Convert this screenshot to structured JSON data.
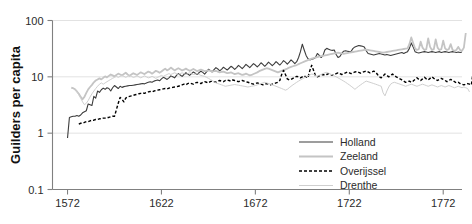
{
  "chart_data": {
    "type": "line",
    "title": "",
    "xlabel": "",
    "ylabel": "Guilders per capita",
    "yscale": "log",
    "ylim": [
      0.1,
      100
    ],
    "xlim": [
      1564,
      1782
    ],
    "grid": true,
    "grid_axis": "y",
    "legend_position": "bottom-right",
    "y_ticks": [
      "100",
      "10",
      "1",
      "0.1"
    ],
    "y_tick_values": [
      100,
      10,
      1,
      0.1
    ],
    "x_ticks": [
      "1572",
      "1622",
      "1672",
      "1722",
      "1772"
    ],
    "x_tick_values": [
      1572,
      1622,
      1672,
      1722,
      1772
    ],
    "series": [
      {
        "name": "Holland",
        "color": "#3c3c3c",
        "width": 1.1,
        "dash": "none",
        "x_start": 1572,
        "x_step": 1,
        "values": [
          0.82,
          1.9,
          1.95,
          2.0,
          2.0,
          2.05,
          2.0,
          2.1,
          2.3,
          2.4,
          2.5,
          3.3,
          3.2,
          3.1,
          4.5,
          4.2,
          5.6,
          5.3,
          5.9,
          6.3,
          6.0,
          6.4,
          6.2,
          5.6,
          6.4,
          7.0,
          6.6,
          6.2,
          6.8,
          6.5,
          6.7,
          6.8,
          6.9,
          7.0,
          7.0,
          7.1,
          7.2,
          7.3,
          7.4,
          7.5,
          7.6,
          7.5,
          7.8,
          8.0,
          8.2,
          8.0,
          8.4,
          8.6,
          8.8,
          8.5,
          9.2,
          9.8,
          9.4,
          9.0,
          9.6,
          10.4,
          10.0,
          9.6,
          10.6,
          11.4,
          10.8,
          10.2,
          11.0,
          11.8,
          11.2,
          10.6,
          11.4,
          12.2,
          11.6,
          11.0,
          11.8,
          12.6,
          12.0,
          11.2,
          12.2,
          13.6,
          13.0,
          12.2,
          13.4,
          14.6,
          13.8,
          12.8,
          13.6,
          14.8,
          14.0,
          13.2,
          14.2,
          15.4,
          14.6,
          13.6,
          14.6,
          16.0,
          15.0,
          14.0,
          15.2,
          16.6,
          15.6,
          14.6,
          15.8,
          17.2,
          16.2,
          15.0,
          16.2,
          17.8,
          16.6,
          15.4,
          16.6,
          18.2,
          17.0,
          15.8,
          17.0,
          18.6,
          17.4,
          16.2,
          17.6,
          19.4,
          18.2,
          16.8,
          18.2,
          20.0,
          18.6,
          17.2,
          18.6,
          22.0,
          28.0,
          38.0,
          30.0,
          24.0,
          21.0,
          20.0,
          20.5,
          21.0,
          22.0,
          26.0,
          24.0,
          22.0,
          24.0,
          30.0,
          32.0,
          31.0,
          30.0,
          29.5,
          30.0,
          25.0,
          22.0,
          23.0,
          26.0,
          28.5,
          29.0,
          28.5,
          28.0,
          28.5,
          32.0,
          34.0,
          35.0,
          36.0,
          35.5,
          35.0,
          34.0,
          29.0,
          26.0,
          25.5,
          25.0,
          24.5,
          25.0,
          25.5,
          26.0,
          25.5,
          25.0,
          24.5,
          25.0,
          24.5,
          24.0,
          24.5,
          25.0,
          25.5,
          26.0,
          26.5,
          27.0,
          26.0,
          27.0,
          28.0,
          32.0,
          40.0,
          34.0,
          28.0,
          27.0,
          26.5,
          27.0,
          27.5,
          28.0,
          27.5,
          27.0,
          27.5,
          28.0,
          27.5,
          27.0,
          27.5,
          28.0,
          27.0,
          27.5,
          28.0,
          27.5,
          27.0,
          27.5,
          28.0,
          27.5,
          27.0,
          27.5,
          27.0,
          27.5
        ]
      },
      {
        "name": "Zeeland",
        "color": "#c4c4c4",
        "width": 1.8,
        "dash": "none",
        "x_start": 1574,
        "x_step": 1,
        "values": [
          6.4,
          6.3,
          6.0,
          5.5,
          5.0,
          4.4,
          4.0,
          4.4,
          5.2,
          6.0,
          6.6,
          7.2,
          8.0,
          8.6,
          9.0,
          9.4,
          9.0,
          9.6,
          10.2,
          9.8,
          10.4,
          11.0,
          10.6,
          10.2,
          10.8,
          11.4,
          11.0,
          10.6,
          11.2,
          11.8,
          11.0,
          10.4,
          11.0,
          11.6,
          11.2,
          10.8,
          11.4,
          12.0,
          11.6,
          11.2,
          11.8,
          12.4,
          12.0,
          11.4,
          12.0,
          12.8,
          12.4,
          11.8,
          12.4,
          13.2,
          14.0,
          13.0,
          13.6,
          14.6,
          13.8,
          13.0,
          13.6,
          14.2,
          13.6,
          13.0,
          13.4,
          14.0,
          13.4,
          12.8,
          13.2,
          13.8,
          13.2,
          12.6,
          13.0,
          13.4,
          13.0,
          12.6,
          12.8,
          13.0,
          12.8,
          12.4,
          12.6,
          12.8,
          12.4,
          12.0,
          12.2,
          12.4,
          12.0,
          11.6,
          11.8,
          12.0,
          11.6,
          11.2,
          11.4,
          11.6,
          11.2,
          10.8,
          11.0,
          11.4,
          11.0,
          10.6,
          10.8,
          11.2,
          11.6,
          12.0,
          12.6,
          13.0,
          13.4,
          13.8,
          14.2,
          14.0,
          13.6,
          13.2,
          12.8,
          12.4,
          12.0,
          12.4,
          12.8,
          13.2,
          13.6,
          14.0,
          14.6,
          15.0,
          15.4,
          15.8,
          16.2,
          16.8,
          17.4,
          18.0,
          18.6,
          19.2,
          19.8,
          20.4,
          21.0,
          21.6,
          22.0,
          22.4,
          22.8,
          23.2,
          23.6,
          24.0,
          24.4,
          24.8,
          25.2,
          25.6,
          26.0,
          26.4,
          26.8,
          26.4,
          26.0,
          25.6,
          26.0,
          26.4,
          26.8,
          27.2,
          27.6,
          28.0,
          28.4,
          28.8,
          29.2,
          29.6,
          30.0,
          30.4,
          30.0,
          29.6,
          29.2,
          28.8,
          28.4,
          28.0,
          27.6,
          27.2,
          26.8,
          27.2,
          27.6,
          28.0,
          28.4,
          28.8,
          29.2,
          29.6,
          30.0,
          30.4,
          30.8,
          31.2,
          31.6,
          32.0,
          38.0,
          50.0,
          40.0,
          32.0,
          30.0,
          31.0,
          42.0,
          33.0,
          30.0,
          31.0,
          48.0,
          34.0,
          30.0,
          31.0,
          46.0,
          33.0,
          30.0,
          31.0,
          44.0,
          32.0,
          30.0,
          31.0,
          38.0,
          30.0,
          29.0,
          30.0,
          34.0,
          30.0,
          29.0,
          33.0,
          60.0
        ]
      },
      {
        "name": "Overijssel",
        "color": "#000000",
        "width": 1.4,
        "dash": "3 2",
        "x_start": 1578,
        "x_step": 1,
        "values": [
          1.45,
          1.5,
          1.5,
          1.55,
          1.6,
          1.6,
          1.65,
          1.7,
          1.7,
          1.75,
          1.75,
          1.8,
          1.8,
          1.85,
          1.85,
          1.9,
          1.9,
          1.95,
          2.0,
          2.0,
          2.6,
          3.4,
          4.3,
          4.0,
          3.6,
          4.2,
          4.4,
          4.5,
          4.6,
          4.7,
          4.8,
          4.9,
          5.0,
          5.1,
          5.2,
          5.1,
          5.3,
          5.4,
          5.5,
          5.4,
          5.6,
          5.7,
          5.8,
          5.9,
          6.0,
          6.1,
          6.2,
          6.1,
          6.3,
          6.4,
          6.5,
          6.6,
          6.7,
          6.8,
          7.0,
          7.2,
          7.4,
          7.2,
          7.6,
          7.8,
          7.6,
          7.4,
          7.8,
          8.0,
          7.8,
          7.6,
          8.0,
          8.2,
          8.0,
          7.8,
          8.2,
          8.4,
          8.2,
          8.0,
          8.4,
          8.6,
          8.4,
          8.2,
          8.6,
          8.8,
          8.6,
          8.4,
          8.8,
          8.6,
          8.4,
          8.2,
          8.4,
          8.6,
          8.4,
          8.2,
          8.0,
          7.8,
          7.6,
          7.4,
          7.6,
          7.8,
          7.6,
          7.4,
          7.2,
          7.4,
          7.6,
          7.4,
          7.2,
          7.4,
          7.6,
          7.8,
          8.0,
          8.6,
          11.0,
          13.0,
          11.0,
          9.2,
          8.8,
          9.0,
          9.4,
          9.8,
          10.2,
          10.0,
          9.6,
          10.0,
          10.4,
          10.0,
          9.6,
          13.0,
          16.0,
          13.0,
          10.5,
          10.0,
          10.4,
          10.8,
          11.0,
          10.6,
          11.0,
          11.4,
          11.0,
          10.6,
          11.0,
          11.4,
          11.8,
          11.4,
          11.0,
          11.4,
          11.8,
          12.2,
          11.8,
          11.4,
          11.8,
          12.2,
          12.4,
          12.0,
          11.6,
          12.0,
          12.4,
          12.6,
          12.2,
          11.8,
          12.2,
          12.6,
          12.2,
          11.0,
          10.0,
          9.6,
          10.4,
          11.2,
          10.6,
          10.0,
          10.6,
          11.2,
          10.6,
          10.0,
          9.6,
          9.2,
          8.8,
          8.4,
          8.0,
          8.2,
          8.4,
          8.0,
          8.4,
          9.0,
          9.6,
          9.0,
          8.6,
          9.2,
          9.8,
          9.2,
          8.8,
          9.4,
          10.0,
          9.4,
          9.0,
          8.6,
          9.0,
          9.4,
          9.0,
          8.6,
          8.2,
          8.6,
          9.0,
          8.6,
          8.2,
          7.8,
          8.0,
          7.6,
          7.4,
          7.2,
          7.4,
          7.6,
          7.4,
          7.2,
          13.0
        ]
      },
      {
        "name": "Drenthe",
        "color": "#cfcfcf",
        "width": 1.0,
        "dash": "none",
        "x_start": 1576,
        "x_step": 1,
        "values": [
          6.0,
          5.4,
          4.8,
          4.2,
          3.6,
          3.2,
          3.4,
          3.8,
          4.4,
          5.0,
          5.6,
          6.2,
          6.8,
          7.4,
          7.8,
          7.4,
          7.8,
          8.2,
          8.6,
          9.0,
          9.4,
          9.8,
          10.2,
          9.8,
          10.2,
          10.6,
          10.2,
          9.8,
          10.2,
          10.6,
          10.2,
          9.8,
          10.0,
          10.4,
          10.0,
          9.6,
          10.0,
          10.4,
          10.0,
          9.6,
          9.8,
          10.2,
          9.8,
          9.4,
          9.8,
          10.2,
          10.6,
          10.2,
          10.6,
          11.0,
          11.4,
          11.0,
          11.4,
          11.8,
          11.4,
          11.0,
          11.4,
          11.8,
          11.4,
          11.0,
          11.4,
          11.8,
          11.4,
          11.0,
          11.2,
          11.4,
          11.0,
          10.6,
          10.4,
          10.2,
          9.8,
          9.4,
          9.0,
          8.6,
          8.2,
          7.8,
          7.6,
          7.4,
          7.2,
          7.0,
          6.8,
          6.9,
          7.0,
          7.1,
          7.2,
          7.3,
          7.2,
          7.1,
          7.0,
          6.9,
          6.8,
          6.7,
          6.6,
          6.7,
          6.8,
          6.9,
          7.0,
          7.2,
          7.4,
          7.6,
          7.8,
          8.0,
          7.8,
          7.6,
          7.4,
          7.2,
          7.0,
          6.8,
          6.6,
          6.4,
          6.2,
          6.0,
          5.8,
          6.0,
          6.4,
          6.8,
          7.2,
          7.6,
          8.0,
          8.4,
          8.8,
          9.2,
          9.6,
          10.0,
          10.4,
          10.8,
          11.2,
          11.0,
          10.6,
          10.2,
          10.6,
          11.0,
          11.4,
          11.8,
          12.0,
          11.6,
          11.2,
          10.8,
          10.4,
          10.0,
          9.6,
          9.2,
          8.8,
          8.4,
          8.0,
          7.6,
          7.2,
          6.8,
          6.4,
          6.0,
          6.4,
          6.8,
          7.2,
          7.6,
          8.0,
          8.4,
          8.2,
          8.0,
          7.8,
          7.6,
          7.4,
          7.2,
          7.0,
          6.8,
          5.2,
          4.6,
          5.6,
          6.6,
          7.4,
          7.8,
          8.0,
          7.8,
          7.6,
          7.4,
          7.2,
          7.0,
          6.8,
          7.0,
          7.2,
          7.4,
          7.2,
          7.0,
          6.8,
          7.0,
          7.2,
          7.4,
          7.2,
          7.0,
          6.8,
          7.0,
          7.2,
          7.0,
          6.8,
          6.6,
          6.8,
          7.0,
          6.8,
          6.6,
          6.8,
          7.0,
          6.8,
          6.6,
          6.4,
          6.6,
          6.8,
          6.6,
          6.4,
          6.6,
          6.4,
          6.2,
          5.4
        ]
      }
    ]
  },
  "legend": {
    "items": [
      {
        "label": "Holland"
      },
      {
        "label": "Zeeland"
      },
      {
        "label": "Overijssel"
      },
      {
        "label": "Drenthe"
      }
    ]
  }
}
